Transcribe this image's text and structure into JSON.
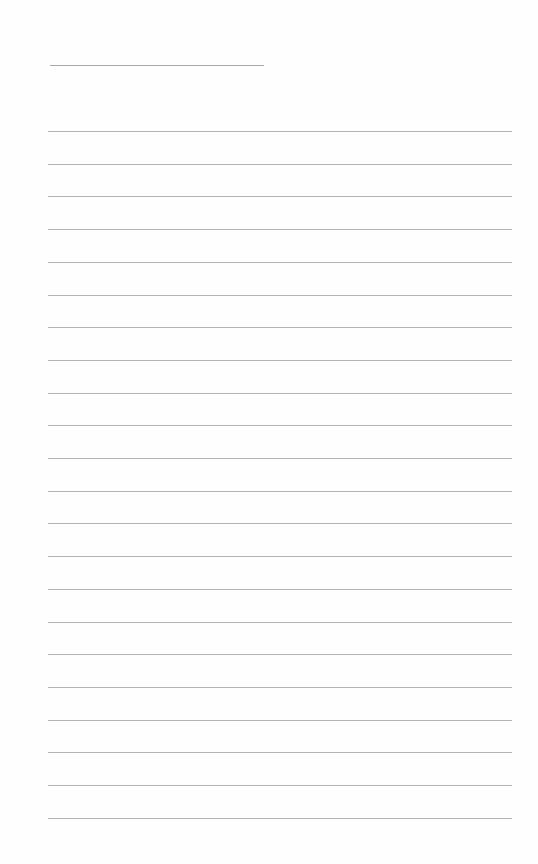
{
  "page": {
    "type": "lined-writing-paper",
    "title_line": {
      "present": true,
      "text": ""
    },
    "ruled_lines": {
      "count": 22,
      "first_y": 131,
      "spacing": 32.7
    },
    "colors": {
      "background": "#fefefe",
      "line": "#b4b4b4"
    }
  }
}
